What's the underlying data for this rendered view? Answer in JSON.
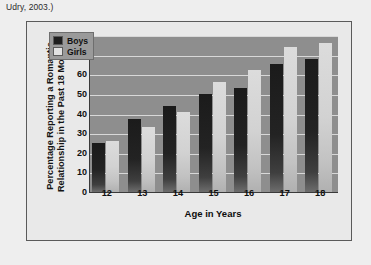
{
  "caption": "Udry, 2003.)",
  "legend": {
    "position": "top-left",
    "entries": [
      {
        "label": "Boys",
        "color": "#1e1e1e"
      },
      {
        "label": "Girls",
        "color": "#e2e2e2"
      }
    ]
  },
  "chart_data": {
    "type": "bar",
    "title": "",
    "xlabel": "Age in Years",
    "ylabel": "Percentage Reporting a Romantic Relationship in the Past 18 Months",
    "categories": [
      "12",
      "13",
      "14",
      "15",
      "16",
      "17",
      "18"
    ],
    "series": [
      {
        "name": "Boys",
        "color": "#1e1e1e",
        "values": [
          25,
          37,
          44,
          50,
          53,
          65,
          68
        ]
      },
      {
        "name": "Girls",
        "color": "#e2e2e2",
        "values": [
          26,
          33,
          41,
          56,
          62,
          74,
          76
        ]
      }
    ],
    "ylim": [
      0,
      80
    ],
    "yticks": [
      0,
      10,
      20,
      30,
      40,
      50,
      60,
      70,
      80
    ],
    "grid": true,
    "legend_position": "top-left"
  }
}
